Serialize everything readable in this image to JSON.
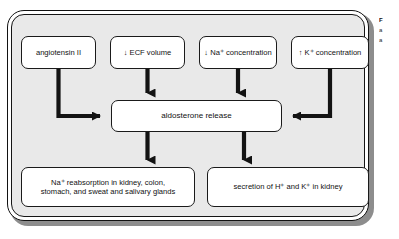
{
  "figure": {
    "panel_color": "#e9e9e9",
    "node_fill": "#ffffff",
    "line_color": "#121212"
  },
  "stimuli": [
    {
      "id": "angiotensin",
      "label": "angiotensin II"
    },
    {
      "id": "ecf-volume",
      "label": "↓ ECF volume"
    },
    {
      "id": "na-conc",
      "label": "↓ Na⁺ concentration"
    },
    {
      "id": "k-conc",
      "label": "↑ K⁺ concentration"
    }
  ],
  "central": {
    "id": "aldosterone-release",
    "label": "aldosterone release"
  },
  "effects": [
    {
      "id": "na-reabsorption",
      "label": "Na⁺ reabsorption in kidney, colon,\nstomach, and sweat and salivary glands"
    },
    {
      "id": "h-k-secretion",
      "label": "secretion of H⁺ and K⁺ in kidney"
    }
  ],
  "arrows": [
    {
      "id": "angiotensin-to-aldosterone",
      "from": "angiotensin",
      "to": "aldosterone-release",
      "shape": "elbow-down-right"
    },
    {
      "id": "ecf-to-aldosterone",
      "from": "ecf-volume",
      "to": "aldosterone-release",
      "shape": "straight-down"
    },
    {
      "id": "na-to-aldosterone",
      "from": "na-conc",
      "to": "aldosterone-release",
      "shape": "straight-down"
    },
    {
      "id": "k-to-aldosterone",
      "from": "k-conc",
      "to": "aldosterone-release",
      "shape": "elbow-down-left"
    },
    {
      "id": "aldosterone-to-reabsorption",
      "from": "aldosterone-release",
      "to": "na-reabsorption",
      "shape": "straight-down"
    },
    {
      "id": "aldosterone-to-secretion",
      "from": "aldosterone-release",
      "to": "h-k-secretion",
      "shape": "straight-down"
    }
  ],
  "margin_note": {
    "title": "F",
    "line1": "a",
    "line2": "a"
  }
}
